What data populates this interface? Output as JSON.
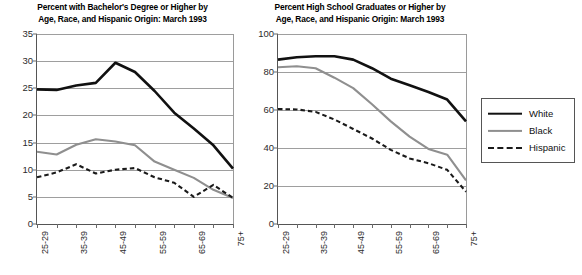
{
  "figure": {
    "background": "#ffffff",
    "panels": [
      {
        "id": "left",
        "title_line1": "Percent with Bachelor's Degree or Higher by",
        "title_line2": "Age, Race, and Hispanic Origin: March 1993"
      },
      {
        "id": "right",
        "title_line1": "Percent High School Graduates or Higher by",
        "title_line2": "Age, Race, and Hispanic Origin: March 1993"
      }
    ]
  },
  "legend": {
    "position": "right",
    "items": [
      {
        "label": "White",
        "style": "solid",
        "color": "#111111",
        "width": 2.6
      },
      {
        "label": "Black",
        "style": "solid",
        "color": "#8f8f8f",
        "width": 2.2
      },
      {
        "label": "Hispanic",
        "style": "dashed",
        "color": "#1a1a1a",
        "width": 2.2
      }
    ]
  },
  "axis": {
    "x_categories": [
      "25-29",
      "30-34",
      "35-39",
      "40-44",
      "45-49",
      "50-54",
      "55-59",
      "60-64",
      "65-69",
      "70-74",
      "75+"
    ],
    "x_labeled_categories": [
      "25-29",
      "35-39",
      "45-49",
      "55-59",
      "65-69",
      "75+"
    ],
    "x_label_indices": [
      0,
      2,
      4,
      6,
      8,
      10
    ]
  },
  "chart_data": [
    {
      "type": "line",
      "id": "bachelors-degree",
      "title": "Percent with Bachelor's Degree or Higher by Age, Race, and Hispanic Origin: March 1993",
      "xlabel": "",
      "ylabel": "",
      "categories": [
        "25-29",
        "30-34",
        "35-39",
        "40-44",
        "45-49",
        "50-54",
        "55-59",
        "60-64",
        "65-69",
        "70-74",
        "75+"
      ],
      "ylim": [
        0,
        35
      ],
      "yticks": [
        0,
        5,
        10,
        15,
        20,
        25,
        30,
        35
      ],
      "grid": true,
      "legend_position": "outside-right",
      "series": [
        {
          "name": "White",
          "style": "solid",
          "color": "#111111",
          "values": [
            24.8,
            24.7,
            25.5,
            26.0,
            29.7,
            28.0,
            24.5,
            20.5,
            17.6,
            14.5,
            10.2
          ]
        },
        {
          "name": "Black",
          "style": "solid",
          "color": "#8f8f8f",
          "values": [
            13.3,
            12.8,
            14.6,
            15.6,
            15.2,
            14.5,
            11.5,
            10.0,
            8.5,
            6.3,
            4.8
          ]
        },
        {
          "name": "Hispanic",
          "style": "dashed",
          "color": "#1a1a1a",
          "values": [
            8.6,
            9.5,
            11.0,
            9.3,
            10.0,
            10.3,
            8.6,
            7.6,
            5.0,
            7.2,
            4.8
          ]
        }
      ]
    },
    {
      "type": "line",
      "id": "high-school-graduates",
      "title": "Percent High School Graduates or Higher by Age, Race, and Hispanic Origin: March 1993",
      "xlabel": "",
      "ylabel": "",
      "categories": [
        "25-29",
        "30-34",
        "35-39",
        "40-44",
        "45-49",
        "50-54",
        "55-59",
        "60-64",
        "65-69",
        "70-74",
        "75+"
      ],
      "ylim": [
        0,
        100
      ],
      "yticks": [
        0,
        20,
        40,
        60,
        80,
        100
      ],
      "grid": true,
      "legend_position": "outside-right",
      "series": [
        {
          "name": "White",
          "style": "solid",
          "color": "#111111",
          "values": [
            86.5,
            87.8,
            88.3,
            88.3,
            86.5,
            82.0,
            76.5,
            73.0,
            69.5,
            65.5,
            54.0
          ]
        },
        {
          "name": "Black",
          "style": "solid",
          "color": "#8f8f8f",
          "values": [
            82.5,
            83.0,
            82.0,
            77.0,
            71.5,
            63.0,
            54.0,
            46.0,
            39.5,
            36.5,
            23.0
          ]
        },
        {
          "name": "Hispanic",
          "style": "dashed",
          "color": "#1a1a1a",
          "values": [
            60.5,
            60.3,
            59.0,
            55.0,
            50.0,
            45.0,
            39.0,
            34.5,
            32.0,
            28.5,
            17.0
          ]
        }
      ]
    }
  ]
}
